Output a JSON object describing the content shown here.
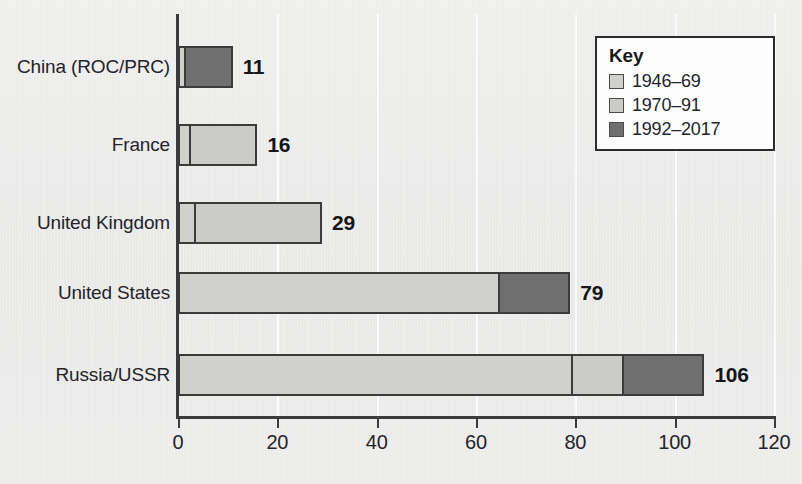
{
  "chart_data": {
    "type": "bar",
    "orientation": "horizontal",
    "stacked": true,
    "title": "",
    "xlabel": "",
    "ylabel": "",
    "xlim": [
      0,
      120
    ],
    "xticks": [
      0,
      20,
      40,
      60,
      80,
      100,
      120
    ],
    "xtick_labels": [
      "0",
      "20",
      "40",
      "60",
      "80",
      "100",
      "120"
    ],
    "grid": "vertical",
    "categories": [
      "China (ROC/PRC)",
      "France",
      "United Kingdom",
      "United States",
      "Russia/USSR"
    ],
    "series": [
      {
        "name": "1946–69",
        "color": "#d0d0cd",
        "values": [
          1,
          2,
          3,
          65,
          80
        ]
      },
      {
        "name": "1970–91",
        "color": "#cbcbc8",
        "values": [
          0,
          14,
          26,
          0,
          10
        ]
      },
      {
        "name": "1992–2017",
        "color": "#6f6f70",
        "values": [
          10,
          0,
          0,
          14,
          16
        ]
      }
    ],
    "totals": [
      11,
      16,
      29,
      79,
      106
    ],
    "data_labels": [
      "11",
      "16",
      "29",
      "79",
      "106"
    ],
    "legend": {
      "title": "Key",
      "position": "top-right",
      "entries": [
        {
          "label": "1946–69",
          "color": "#d0d0cd"
        },
        {
          "label": "1970–91",
          "color": "#cbcbc8"
        },
        {
          "label": "1992–2017",
          "color": "#6f6f70"
        }
      ]
    },
    "colors": {
      "background": "#ececeb",
      "axis": "#3b3b3b",
      "gridline": "#fbfbfb",
      "text": "#24242a",
      "bar_outline": "#3b3b3b",
      "legend_background": "#fdfdfd",
      "legend_border": "#2c2c2c"
    }
  }
}
